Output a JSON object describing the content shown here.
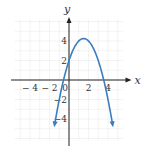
{
  "chart_data": {
    "type": "line",
    "title": "",
    "xlabel": "x",
    "ylabel": "y",
    "xlim": [
      -6,
      6
    ],
    "ylim": [
      -6,
      6
    ],
    "grid": true,
    "x_tick_labels": [
      "-4",
      "-2",
      "0",
      "2",
      "4"
    ],
    "y_tick_labels": [
      "4",
      "2",
      "-2",
      "-4"
    ],
    "series": [
      {
        "name": "f(x) = -x^2 + 3x + 2",
        "color": "#3a7ebf",
        "x": [
          -1.2,
          -0.56,
          0,
          0.5,
          1,
          1.5,
          2,
          2.5,
          3,
          3.56,
          4.2
        ],
        "y": [
          -3.04,
          0,
          2,
          3.25,
          4,
          4.25,
          4,
          3.25,
          2,
          0,
          -3.04
        ],
        "vertex": [
          1.5,
          4.25
        ],
        "y_intercept": 2,
        "x_intercepts": [
          -0.56,
          3.56
        ],
        "arrows_at_ends": true
      }
    ]
  },
  "colors": {
    "curve": "#3a7ebf",
    "grid": "#d9d9d9",
    "axis": "#222222"
  }
}
